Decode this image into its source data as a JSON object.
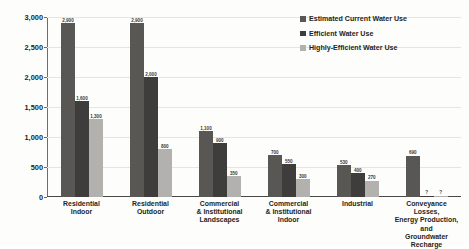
{
  "chart_data": {
    "type": "bar",
    "title": "",
    "xlabel": "",
    "ylabel": "Thousand acre-feet per year (tafy)",
    "ylim": [
      0,
      3000
    ],
    "yticks": [
      "0",
      "500",
      "1,000",
      "1,500",
      "2,000",
      "2,500",
      "3,000"
    ],
    "ytick_values": [
      0,
      500,
      1000,
      1500,
      2000,
      2500,
      3000
    ],
    "grid": true,
    "legend_position": "top-right",
    "categories": [
      "Residential Indoor",
      "Residential Outdoor",
      "Commercial & Institutional Landscapes",
      "Commercial & Institutional Indoor",
      "Industrial",
      "Conveyance Losses, Energy Production, and Groundwater Recharge"
    ],
    "category_lines": [
      [
        "Residential",
        "Indoor"
      ],
      [
        "Residential",
        "Outdoor"
      ],
      [
        "Commercial",
        "& Institutional",
        "Landscapes"
      ],
      [
        "Commercial",
        "& Institutional",
        "Indoor"
      ],
      [
        "Industrial"
      ],
      [
        "Conveyance Losses,",
        "Energy Production, and",
        "Groundwater Recharge"
      ]
    ],
    "series": [
      {
        "name": "Estimated Current Water Use",
        "color": "#595754",
        "values": [
          2900,
          2900,
          1100,
          700,
          530,
          690
        ],
        "labels": [
          "2,900",
          "2,900",
          "1,100",
          "700",
          "530",
          "690"
        ]
      },
      {
        "name": "Efficient Water Use",
        "color": "#3f3d3b",
        "values": [
          1600,
          2000,
          900,
          550,
          400,
          20
        ],
        "labels": [
          "1,600",
          "2,000",
          "900",
          "550",
          "400",
          "?"
        ]
      },
      {
        "name": "Highly-Efficient Water Use",
        "color": "#b3b1ad",
        "values": [
          1300,
          800,
          350,
          300,
          270,
          20
        ],
        "labels": [
          "1,300",
          "800",
          "350",
          "300",
          "270",
          "?"
        ]
      }
    ]
  },
  "legend": {
    "items": [
      {
        "label": "Estimated Current Water Use",
        "swatch": "legend-swatch-estimated-current"
      },
      {
        "label": "Efficient Water Use",
        "swatch": "legend-swatch-efficient"
      },
      {
        "label": "Highly-Efficient Water Use",
        "swatch": "legend-swatch-highly-efficient"
      }
    ]
  }
}
